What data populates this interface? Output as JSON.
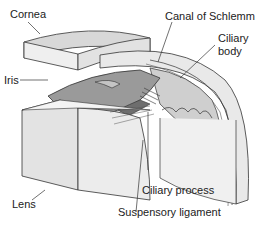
{
  "diagram": {
    "labels": {
      "cornea": "Cornea",
      "canal": "Canal of Schlemm",
      "ciliary_body_1": "Ciliary",
      "ciliary_body_2": "body",
      "iris": "Iris",
      "lens": "Lens",
      "ciliary_process": "Ciliary process",
      "suspensory": "Suspensory ligament"
    },
    "colors": {
      "tissue_light": "#e6e6e6",
      "tissue_mid": "#c8c8c8",
      "iris": "#9a9a9a",
      "iris_dark": "#6e6e6e",
      "outline": "#333333",
      "text": "#222222"
    }
  }
}
